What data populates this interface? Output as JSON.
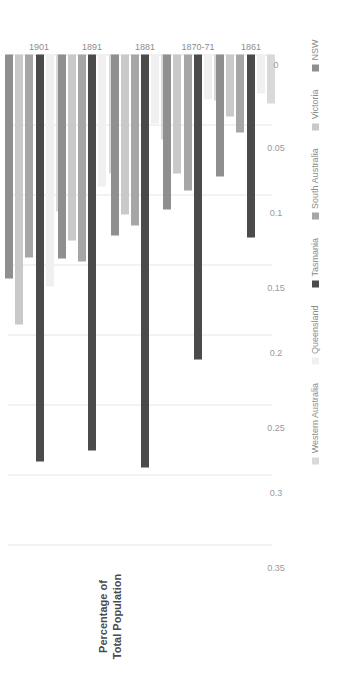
{
  "chart_data": {
    "type": "bar",
    "orientation": "horizontal",
    "title": "",
    "xlabel": "Percentage of Total Population",
    "ylabel": "",
    "categories": [
      "1861",
      "1870-71",
      "1881",
      "1891",
      "1901"
    ],
    "tick_labels": [
      "0.35",
      "0.3",
      "0.25",
      "0.2",
      "0.15",
      "0.1",
      "0.05",
      "0"
    ],
    "tick_values": [
      0.35,
      0.3,
      0.25,
      0.2,
      0.15,
      0.1,
      0.05,
      0
    ],
    "xlim": [
      0,
      0.35
    ],
    "axis_direction": "reversed",
    "grid": true,
    "legend_position": "right",
    "series": [
      {
        "name": "NSW",
        "color": "#8f8f8f",
        "values": [
          0.0875,
          0.1105,
          0.1295,
          0.1455,
          0.16
        ]
      },
      {
        "name": "Victoria",
        "color": "#c9c9c9",
        "values": [
          0.044,
          0.085,
          0.114,
          0.133,
          0.193
        ]
      },
      {
        "name": "South Australia",
        "color": "#a6a6a6",
        "values": [
          0.0555,
          0.097,
          0.122,
          0.148,
          0.145
        ]
      },
      {
        "name": "Tasmania",
        "color": "#4b4b4b",
        "values": [
          0.131,
          0.218,
          0.295,
          0.283,
          0.291
        ]
      },
      {
        "name": "Queensland",
        "color": "#f0f0f0",
        "values": [
          0.028,
          0.032,
          0.049,
          0.094,
          0.166
        ]
      },
      {
        "name": "Western Australia",
        "color": "#d9d9d9",
        "values": [
          0.035,
          0.033,
          0.061,
          0.085,
          0.1125
        ]
      }
    ]
  },
  "legend": {
    "items": [
      {
        "label": "NSW",
        "color": "#8f8f8f"
      },
      {
        "label": "Victoria",
        "color": "#c9c9c9"
      },
      {
        "label": "South Australia",
        "color": "#a6a6a6"
      },
      {
        "label": "Tasmania",
        "color": "#4b4b4b"
      },
      {
        "label": "Queensland",
        "color": "#f0f0f0"
      },
      {
        "label": "Western Australia",
        "color": "#d9d9d9"
      }
    ]
  },
  "axis": {
    "value_axis_title": "Percentage of\nTotal Population",
    "value_axis_title_line1": "Percentage of",
    "value_axis_title_line2": "Total Population"
  },
  "style": {
    "background": "#ffffff",
    "gridline_color": "#e6e6e6",
    "tick_text_color": "#9a9a9a",
    "category_text_color": "#8c8c8c",
    "axis_title_color": "#4a4a4a"
  }
}
